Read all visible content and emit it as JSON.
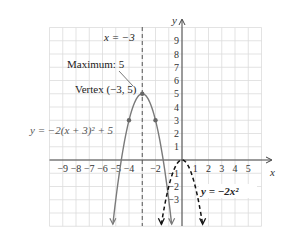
{
  "chart_data": {
    "type": "line",
    "title": "",
    "xlabel": "x",
    "ylabel": "y",
    "xlim": [
      -10,
      6
    ],
    "ylim": [
      -5,
      10
    ],
    "grid": true,
    "x_ticks": [
      "-9",
      "-8",
      "-7",
      "-6",
      "-5",
      "-4",
      "-2",
      "1",
      "2",
      "3",
      "4",
      "5"
    ],
    "y_ticks": [
      "9",
      "8",
      "7",
      "6",
      "5",
      "4",
      "3",
      "2",
      "1",
      "-1",
      "-2",
      "-3"
    ],
    "series": [
      {
        "name": "y = -2(x + 3)^2 + 5",
        "style": "solid",
        "color": "#7a7a7a",
        "points": [
          [
            -5.24,
            -5
          ],
          [
            -5,
            -3
          ],
          [
            -4,
            3
          ],
          [
            -3,
            5
          ],
          [
            -2,
            3
          ],
          [
            -1,
            -3
          ],
          [
            -0.76,
            -5
          ]
        ],
        "marked_points": [
          [
            -4,
            3
          ],
          [
            -3,
            5
          ],
          [
            -2,
            3
          ]
        ]
      },
      {
        "name": "y = -2x^2",
        "style": "dashed",
        "color": "#111111",
        "points": [
          [
            -1.58,
            -5
          ],
          [
            -1,
            -2
          ],
          [
            0,
            0
          ],
          [
            1,
            -2
          ],
          [
            1.58,
            -5
          ]
        ]
      }
    ],
    "annotations": [
      {
        "text": "x = −3",
        "type": "axis-of-symmetry",
        "x": -3,
        "style": "dashed"
      },
      {
        "text": "Maximum: 5"
      },
      {
        "text": "Vertex (−3, 5)",
        "point": [
          -3,
          5
        ]
      },
      {
        "text": "y = −2(x + 3)² + 5"
      },
      {
        "text": "y = −2x²"
      }
    ]
  },
  "labels": {
    "axis_of_symmetry": "x = −3",
    "maximum": "Maximum: 5",
    "vertex": "Vertex (−3, 5)",
    "eq_shifted": "y = −2(x + 3)² + 5",
    "eq_base": "y = −2x²",
    "x_axis": "x",
    "y_axis": "y"
  },
  "ticks": {
    "x": [
      {
        "v": -9,
        "t": "−9"
      },
      {
        "v": -8,
        "t": "−8"
      },
      {
        "v": -7,
        "t": "−7"
      },
      {
        "v": -6,
        "t": "−6"
      },
      {
        "v": -5,
        "t": "−5"
      },
      {
        "v": -4,
        "t": "−4"
      },
      {
        "v": -2,
        "t": "−2"
      },
      {
        "v": 1,
        "t": "1"
      },
      {
        "v": 2,
        "t": "2"
      },
      {
        "v": 3,
        "t": "3"
      },
      {
        "v": 4,
        "t": "4"
      },
      {
        "v": 5,
        "t": "5"
      }
    ],
    "y": [
      {
        "v": 9,
        "t": "9"
      },
      {
        "v": 8,
        "t": "8"
      },
      {
        "v": 7,
        "t": "7"
      },
      {
        "v": 6,
        "t": "6"
      },
      {
        "v": 5,
        "t": "5"
      },
      {
        "v": 4,
        "t": "4"
      },
      {
        "v": 3,
        "t": "3"
      },
      {
        "v": 2,
        "t": "2"
      },
      {
        "v": 1,
        "t": "1"
      },
      {
        "v": -1,
        "t": "−1"
      },
      {
        "v": -2,
        "t": "−2"
      },
      {
        "v": -3,
        "t": "−3"
      }
    ]
  }
}
